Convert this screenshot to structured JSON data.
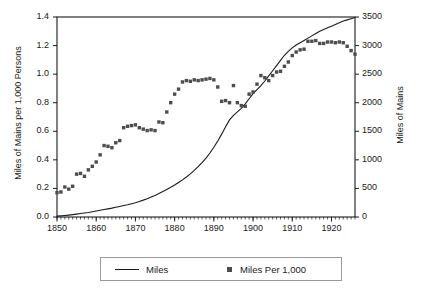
{
  "chart_data": {
    "type": "line",
    "title": "",
    "xlabel": "",
    "ylabel": "Miles of Mains per 1,000 Persons",
    "ylabel_right": "Miles of Mains",
    "xlim": [
      1850,
      1926
    ],
    "ylim": [
      0.0,
      1.4
    ],
    "ylim_right": [
      0,
      3500
    ],
    "grid": false,
    "legend_position": "bottom",
    "x_ticks": [
      "1850",
      "1860",
      "1870",
      "1880",
      "1890",
      "1900",
      "1910",
      "1920"
    ],
    "x_tick_values": [
      1850,
      1860,
      1870,
      1880,
      1890,
      1900,
      1910,
      1920
    ],
    "x_minor_tick_interval": 1,
    "y_ticks_left": [
      "0.0",
      "0.2",
      "0.4",
      "0.6",
      "0.8",
      "1.0",
      "1.2",
      "1.4"
    ],
    "y_tick_values_left": [
      0.0,
      0.2,
      0.4,
      0.6,
      0.8,
      1.0,
      1.2,
      1.4
    ],
    "y_ticks_right": [
      "0",
      "500",
      "1000",
      "1500",
      "2000",
      "2500",
      "3000",
      "3500"
    ],
    "y_tick_values_right": [
      0,
      500,
      1000,
      1500,
      2000,
      2500,
      3000,
      3500
    ],
    "series": [
      {
        "name": "Miles",
        "axis": "right",
        "style": "line",
        "color": "#1a1a1a",
        "x": [
          1850,
          1851,
          1852,
          1853,
          1854,
          1855,
          1856,
          1857,
          1858,
          1859,
          1860,
          1861,
          1862,
          1863,
          1864,
          1865,
          1866,
          1867,
          1868,
          1869,
          1870,
          1871,
          1872,
          1873,
          1874,
          1875,
          1876,
          1877,
          1878,
          1879,
          1880,
          1881,
          1882,
          1883,
          1884,
          1885,
          1886,
          1887,
          1888,
          1889,
          1890,
          1891,
          1892,
          1893,
          1894,
          1895,
          1896,
          1897,
          1898,
          1899,
          1900,
          1901,
          1902,
          1903,
          1904,
          1905,
          1906,
          1907,
          1908,
          1909,
          1910,
          1911,
          1912,
          1913,
          1914,
          1915,
          1916,
          1917,
          1918,
          1919,
          1920,
          1921,
          1922,
          1923,
          1924,
          1925,
          1926
        ],
        "values": [
          15,
          20,
          26,
          33,
          41,
          50,
          60,
          70,
          80,
          92,
          105,
          118,
          130,
          142,
          155,
          170,
          185,
          200,
          215,
          232,
          250,
          272,
          295,
          320,
          348,
          378,
          410,
          445,
          482,
          520,
          560,
          605,
          650,
          700,
          755,
          815,
          880,
          950,
          1030,
          1120,
          1220,
          1330,
          1450,
          1580,
          1700,
          1780,
          1840,
          1900,
          1980,
          2070,
          2160,
          2230,
          2300,
          2380,
          2470,
          2560,
          2650,
          2740,
          2830,
          2900,
          2960,
          3010,
          3050,
          3090,
          3130,
          3170,
          3210,
          3250,
          3280,
          3310,
          3340,
          3370,
          3400,
          3430,
          3450,
          3470,
          3490
        ]
      },
      {
        "name": "Miles Per 1,000",
        "axis": "left",
        "style": "markers",
        "color": "#4d4d4d",
        "marker": "square",
        "x": [
          1850,
          1851,
          1852,
          1853,
          1854,
          1855,
          1856,
          1857,
          1858,
          1859,
          1860,
          1861,
          1862,
          1863,
          1864,
          1865,
          1866,
          1867,
          1868,
          1869,
          1870,
          1871,
          1872,
          1873,
          1874,
          1875,
          1876,
          1877,
          1878,
          1879,
          1880,
          1881,
          1882,
          1883,
          1884,
          1885,
          1886,
          1887,
          1888,
          1889,
          1890,
          1891,
          1892,
          1893,
          1894,
          1895,
          1896,
          1897,
          1898,
          1899,
          1900,
          1901,
          1902,
          1903,
          1904,
          1905,
          1906,
          1907,
          1908,
          1909,
          1910,
          1911,
          1912,
          1913,
          1914,
          1915,
          1916,
          1917,
          1918,
          1919,
          1920,
          1921,
          1922,
          1923,
          1924,
          1925,
          1926
        ],
        "values": [
          0.17,
          0.175,
          0.21,
          0.195,
          0.215,
          0.3,
          0.305,
          0.285,
          0.33,
          0.355,
          0.385,
          0.435,
          0.5,
          0.495,
          0.485,
          0.52,
          0.535,
          0.625,
          0.635,
          0.64,
          0.645,
          0.625,
          0.615,
          0.605,
          0.61,
          0.605,
          0.665,
          0.66,
          0.735,
          0.8,
          0.86,
          0.895,
          0.945,
          0.955,
          0.95,
          0.96,
          0.955,
          0.96,
          0.965,
          0.97,
          0.96,
          0.91,
          0.81,
          0.815,
          0.8,
          0.92,
          0.8,
          0.78,
          0.775,
          0.86,
          0.875,
          0.93,
          0.99,
          0.975,
          0.955,
          0.99,
          1.015,
          1.02,
          1.055,
          1.085,
          1.13,
          1.155,
          1.17,
          1.175,
          1.23,
          1.23,
          1.235,
          1.215,
          1.215,
          1.225,
          1.225,
          1.22,
          1.225,
          1.22,
          1.195,
          1.165,
          1.14
        ]
      }
    ]
  },
  "legend": {
    "miles_label": "Miles",
    "per_thousand_label": "Miles Per 1,000"
  },
  "colors": {
    "line": "#1a1a1a",
    "marker": "#4d4d4d",
    "axis": "#1a1a1a",
    "background": "#ffffff"
  }
}
